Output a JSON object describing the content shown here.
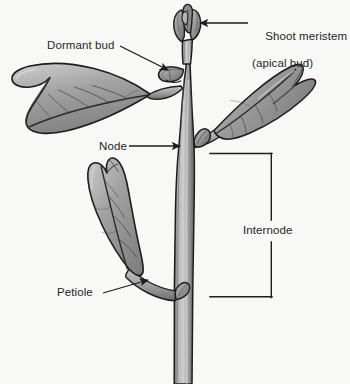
{
  "figure": {
    "background_color": "#f8f8f6",
    "line_color": "#1d1d1d",
    "text_color": "#262626",
    "leaf_fill_light": "#c3c3c3",
    "leaf_fill_mid": "#9c9c9c",
    "leaf_fill_dark": "#7b7b7b",
    "stem_fill_light": "#c9c9c9",
    "stem_fill_mid": "#9a9a9a",
    "stem_fill_dark": "#6f6f6f"
  },
  "labels": {
    "shoot_meristem": {
      "line1": "Shoot meristem",
      "line2": "(apical bud)"
    },
    "dormant_bud": "Dormant bud",
    "node": "Node",
    "internode": "Internode",
    "petiole": "Petiole"
  },
  "parts": [
    "apical bud",
    "dormant bud",
    "node",
    "internode",
    "petiole",
    "leaf blade",
    "stem",
    "axillary bud"
  ]
}
